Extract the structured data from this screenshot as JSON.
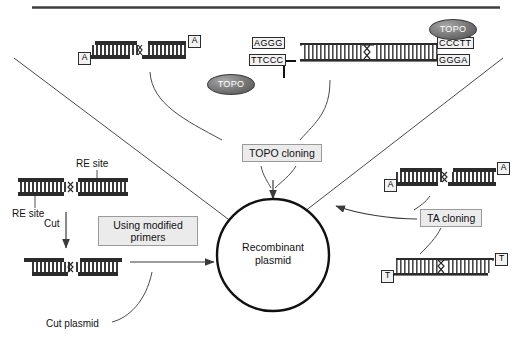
{
  "figure": {
    "center_line1": "Recombinant",
    "center_line2": "plasmid"
  },
  "labels": {
    "topo_cloning": "TOPO  cloning",
    "ta_cloning": "TA  cloning",
    "modified_primers": "Using modified primers",
    "re_site_top": "RE site",
    "re_site_bottom": "RE site",
    "cut": "Cut",
    "cut_plasmid": "Cut plasmid"
  },
  "topo_enzyme": {
    "name": "TOPO",
    "count": 2
  },
  "sequences": {
    "topo_left_top": "AGGG",
    "topo_left_bottom": "TTCCC",
    "topo_right_top": "CCCTT",
    "topo_right_bottom": "GGGA"
  },
  "overhangs": {
    "a": "A",
    "t": "T"
  },
  "constructs": [
    {
      "id": "pcr-product-a-overhang",
      "name": "PCR product with A overhangs",
      "left_end": "A",
      "right_end": "A"
    },
    {
      "id": "topo-vector",
      "name": "TOPO adapted vector with topoisomerase",
      "left_top": "AGGG",
      "left_bottom": "TTCCC",
      "right_top": "CCCTT",
      "right_bottom": "GGGA"
    },
    {
      "id": "re-insert",
      "name": "Insert flanked by RE sites"
    },
    {
      "id": "cut-plasmid",
      "name": "Cut plasmid"
    },
    {
      "id": "ta-insert",
      "name": "Insert with A overhangs",
      "left_end": "A",
      "right_end": "A"
    },
    {
      "id": "ta-vector",
      "name": "Linearized vector with T overhangs",
      "left_end": "T",
      "right_end": "T"
    }
  ],
  "colors": {
    "stroke": "#3a3a3a",
    "dna_dark": "#2b2b2b",
    "box_fill": "#ebebeb",
    "box_border": "#9a9a9a",
    "topo_fill": "#6e6e6e",
    "background": "#ffffff"
  }
}
